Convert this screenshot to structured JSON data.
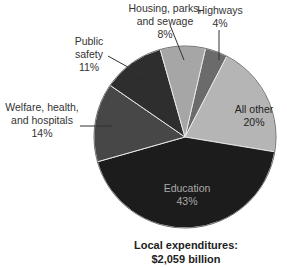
{
  "chart_data": {
    "type": "pie",
    "title": "Local expenditures: $2,059 billion",
    "start_angle_deg": 13,
    "direction": "clockwise",
    "slices": [
      {
        "label": "Highways",
        "value": 4,
        "pct": "4%",
        "color": "#6b6b6b"
      },
      {
        "label": "All other",
        "value": 20,
        "pct": "20%",
        "color": "#b5b5b5"
      },
      {
        "label": "Education",
        "value": 43,
        "pct": "43%",
        "color": "#1c1c1c"
      },
      {
        "label": "Welfare, health, and hospitals",
        "value": 14,
        "pct": "14%",
        "color": "#474747"
      },
      {
        "label": "Public safety",
        "value": 11,
        "pct": "11%",
        "color": "#2e2e2e"
      },
      {
        "label": "Housing, parks, and sewage",
        "value": 8,
        "pct": "8%",
        "color": "#a6a6a6"
      }
    ]
  },
  "labels": {
    "housing": "Housing, parks,\nand sewage\n8%",
    "highways": "Highways\n4%",
    "public_safety": "Public\nsafety\n11%",
    "welfare": "Welfare, health,\nand hospitals\n14%",
    "all_other": "All other\n20%",
    "education": "Education\n43%"
  },
  "caption": {
    "line1": "Local expenditures:",
    "line2": "$2,059 billion"
  }
}
